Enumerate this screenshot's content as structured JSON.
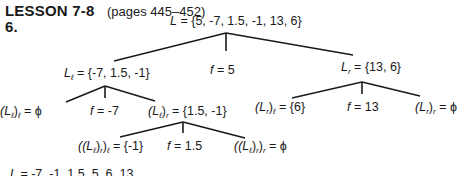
{
  "header": {
    "lesson": "LESSON 7-8",
    "pages": "(pages 445–452)",
    "problem_number": "6."
  },
  "tree": {
    "root": {
      "lhs": "L",
      "rhs": "= {5, -7, 1.5, -1, 13, 6}"
    },
    "level1": {
      "left": {
        "lhs": "L",
        "sub": "ℓ",
        "rhs": "= {-7, 1.5, -1}"
      },
      "pivot": {
        "lhs": "f",
        "rhs": "= 5"
      },
      "right": {
        "lhs": "L",
        "sub": "r",
        "rhs": "= {13, 6}"
      }
    },
    "level2_left": {
      "left": {
        "lhs": "(L",
        "sub1": "ℓ",
        "mid": ")",
        "sub2": "ℓ",
        "rhs": "= ϕ"
      },
      "pivot": {
        "lhs": "f",
        "rhs": "= -7"
      },
      "right": {
        "lhs": "(L",
        "sub1": "ℓ",
        "mid": ")",
        "sub2": "r",
        "rhs": "= {1.5, -1}"
      }
    },
    "level2_right": {
      "left": {
        "lhs": "(L",
        "sub1": "r",
        "mid": ")",
        "sub2": "ℓ",
        "rhs": "= {6}"
      },
      "pivot": {
        "lhs": "f",
        "rhs": "= 13"
      },
      "right": {
        "lhs": "(L",
        "sub1": "r",
        "mid": ")",
        "sub2": "r",
        "rhs": "= ϕ"
      }
    },
    "level3": {
      "left": {
        "lhs": "((L",
        "sub1": "ℓ",
        "mid1": ")",
        "sub2": "r",
        "mid2": ")",
        "sub3": "ℓ",
        "rhs": "= {-1}"
      },
      "pivot": {
        "lhs": "f",
        "rhs": "= 1.5"
      },
      "right": {
        "lhs": "((L",
        "sub1": "ℓ",
        "mid1": ")",
        "sub2": "r",
        "mid2": ")",
        "sub3": "r",
        "rhs": "= ϕ"
      }
    }
  },
  "result": {
    "lhs": "L",
    "rhs": "= -7, -1, 1.5, 5, 6, 13"
  },
  "colors": {
    "ink": "#1a1a1a",
    "background": "#ffffff"
  }
}
